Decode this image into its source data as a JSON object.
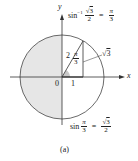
{
  "figure": {
    "caption": "(a)",
    "axes": {
      "x_label": "x",
      "y_label": "y",
      "origin_label": "0"
    },
    "triangle": {
      "hypotenuse_label": "2",
      "base_label": "1",
      "height_label_root": "3",
      "angle_num": "π",
      "angle_den": "3"
    },
    "top_equation": {
      "func": "sin",
      "superscript": "−1",
      "arg_num_root": "3",
      "arg_den": "2",
      "equals": "=",
      "result_num": "π",
      "result_den": "3"
    },
    "bottom_equation": {
      "func": "sin",
      "arg_num": "π",
      "arg_den": "3",
      "equals": "=",
      "result_num_root": "3",
      "result_den": "2"
    },
    "colors": {
      "shading": "#e6e6e6",
      "lines": "#333333",
      "angle_fill": "#c8c8c8"
    }
  }
}
